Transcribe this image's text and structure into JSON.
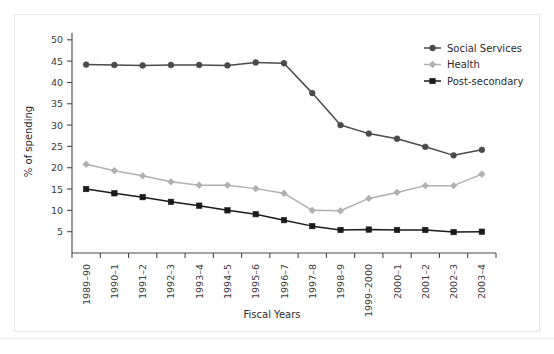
{
  "chart_data": {
    "type": "line",
    "title": "",
    "xlabel": "Fiscal Years",
    "ylabel": "% of spending",
    "categories": [
      "1989–90",
      "1990–1",
      "1991–2",
      "1992–3",
      "1993–4",
      "1994–5",
      "1995–6",
      "1996–7",
      "1997–8",
      "1998–9",
      "1999–2000",
      "2000–1",
      "2001–2",
      "2002–3",
      "2003–4"
    ],
    "ylim": [
      0,
      52
    ],
    "yticks": [
      5,
      10,
      15,
      20,
      25,
      30,
      35,
      40,
      45,
      50
    ],
    "grid": false,
    "legend_position": "top-right",
    "series": [
      {
        "name": "Social Services",
        "color": "#4a4a4a",
        "marker": "circle",
        "values": [
          44.2,
          44.1,
          44.0,
          44.1,
          44.1,
          44.0,
          44.7,
          44.5,
          37.5,
          30.0,
          28.0,
          26.8,
          24.9,
          22.9,
          24.2
        ]
      },
      {
        "name": "Health",
        "color": "#b0b0b0",
        "marker": "diamond",
        "values": [
          20.8,
          19.3,
          18.1,
          16.7,
          15.9,
          15.9,
          15.1,
          14.0,
          10.0,
          9.9,
          12.8,
          14.2,
          15.8,
          15.8,
          18.5
        ]
      },
      {
        "name": "Post-secondary",
        "color": "#1a1a1a",
        "marker": "square",
        "values": [
          15.0,
          14.0,
          13.1,
          12.0,
          11.1,
          10.0,
          9.1,
          7.7,
          6.3,
          5.4,
          5.5,
          5.4,
          5.4,
          4.9,
          5.0
        ]
      }
    ]
  }
}
